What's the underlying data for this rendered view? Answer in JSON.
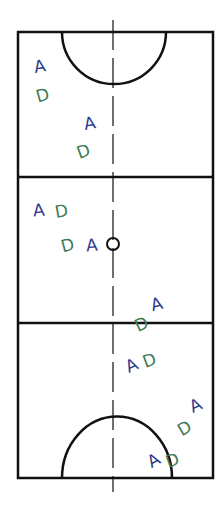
{
  "diagram": {
    "title": "",
    "type": "netball-court",
    "colors": {
      "court_lines": "#111111",
      "attacker": "#2e3a8c",
      "defender": "#3f7a57",
      "background": "#ffffff"
    },
    "court": {
      "left": 18,
      "right": 213,
      "top": 32,
      "bottom": 478,
      "third_lines_y": [
        177,
        323
      ],
      "center_x": 113
    },
    "markers": [
      {
        "id": "a1",
        "label": "A",
        "role": "attacker",
        "x": 34,
        "y": 58,
        "rot": -10
      },
      {
        "id": "d1",
        "label": "D",
        "role": "defender",
        "x": 36,
        "y": 87,
        "rot": -15
      },
      {
        "id": "a2",
        "label": "A",
        "role": "attacker",
        "x": 84,
        "y": 115,
        "rot": -10
      },
      {
        "id": "d2",
        "label": "D",
        "role": "defender",
        "x": 77,
        "y": 143,
        "rot": -20
      },
      {
        "id": "a3",
        "label": "A",
        "role": "attacker",
        "x": 33,
        "y": 202,
        "rot": -5
      },
      {
        "id": "d3",
        "label": "D",
        "role": "defender",
        "x": 55,
        "y": 203,
        "rot": -10
      },
      {
        "id": "d4",
        "label": "D",
        "role": "defender",
        "x": 61,
        "y": 237,
        "rot": -15
      },
      {
        "id": "a4",
        "label": "A",
        "role": "attacker",
        "x": 86,
        "y": 237,
        "rot": -5
      },
      {
        "id": "a5",
        "label": "A",
        "role": "attacker",
        "x": 151,
        "y": 296,
        "rot": -15
      },
      {
        "id": "d5",
        "label": "D",
        "role": "defender",
        "x": 135,
        "y": 316,
        "rot": -25
      },
      {
        "id": "a6",
        "label": "A",
        "role": "attacker",
        "x": 126,
        "y": 357,
        "rot": -25
      },
      {
        "id": "d6",
        "label": "D",
        "role": "defender",
        "x": 143,
        "y": 352,
        "rot": -20
      },
      {
        "id": "a7",
        "label": "A",
        "role": "attacker",
        "x": 190,
        "y": 397,
        "rot": -25
      },
      {
        "id": "d7",
        "label": "D",
        "role": "defender",
        "x": 178,
        "y": 420,
        "rot": -30
      },
      {
        "id": "a8",
        "label": "A",
        "role": "attacker",
        "x": 148,
        "y": 452,
        "rot": -30
      },
      {
        "id": "d8",
        "label": "D",
        "role": "defender",
        "x": 166,
        "y": 452,
        "rot": -20
      }
    ]
  }
}
